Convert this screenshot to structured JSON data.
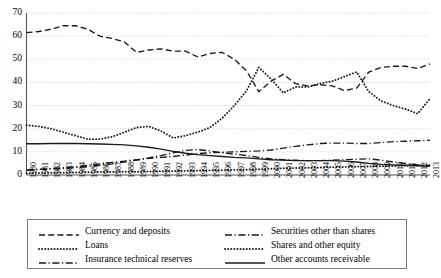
{
  "chart_data": {
    "type": "line",
    "title": "",
    "xlabel": "",
    "ylabel": "",
    "ylim": [
      0,
      70
    ],
    "ytick_step": 10,
    "grid": true,
    "legend_position": "bottom",
    "yticks": [
      "0",
      "10",
      "20",
      "30",
      "40",
      "50",
      "60",
      "70"
    ],
    "categories": [
      "1980",
      "1981",
      "1982",
      "1983",
      "1984",
      "1985",
      "1986",
      "1987",
      "1988",
      "1989",
      "1990",
      "1991",
      "1992",
      "1993",
      "1994",
      "1995",
      "1996",
      "1997",
      "1998",
      "1999",
      "2000",
      "2001",
      "2002",
      "2003",
      "2004",
      "2005",
      "2006",
      "2007",
      "2008",
      "2009",
      "2010",
      "2011",
      "2012",
      "2013"
    ],
    "series": [
      {
        "name": "Currency and deposits",
        "style": "dashed",
        "values": [
          61.5,
          62.0,
          63.0,
          64.5,
          64.5,
          63.0,
          60.0,
          59.0,
          57.5,
          53.0,
          54.0,
          54.5,
          53.5,
          53.5,
          51.0,
          52.5,
          53.0,
          50.0,
          45.0,
          36.0,
          40.5,
          43.5,
          39.5,
          38.5,
          39.0,
          38.5,
          36.5,
          37.5,
          44.5,
          46.5,
          47.0,
          47.0,
          46.0,
          48.0
        ]
      },
      {
        "name": "Loans",
        "style": "dotted",
        "values": [
          0.8,
          0.9,
          1.0,
          1.0,
          1.1,
          1.2,
          1.3,
          1.3,
          1.4,
          1.4,
          1.5,
          1.6,
          1.7,
          1.8,
          1.9,
          2.0,
          2.1,
          2.2,
          2.3,
          2.5,
          2.7,
          2.9,
          3.0,
          3.1,
          3.2,
          3.4,
          3.5,
          3.6,
          3.7,
          3.8,
          3.9,
          4.0,
          4.1,
          4.2
        ]
      },
      {
        "name": "Insurance technical reserves",
        "style": "dashdot",
        "values": [
          2.0,
          2.4,
          2.8,
          3.2,
          3.6,
          4.2,
          4.8,
          5.4,
          6.0,
          6.6,
          7.2,
          7.6,
          8.0,
          8.6,
          9.2,
          9.6,
          9.8,
          10.0,
          10.2,
          10.4,
          10.8,
          11.6,
          12.4,
          13.0,
          13.6,
          13.8,
          13.8,
          13.6,
          13.6,
          14.0,
          14.4,
          14.6,
          14.8,
          15.0
        ]
      },
      {
        "name": "Securities other than shares",
        "style": "dashdot",
        "values": [
          2.2,
          2.4,
          2.6,
          2.8,
          3.2,
          3.6,
          4.2,
          4.8,
          5.6,
          6.4,
          7.4,
          8.4,
          9.6,
          10.6,
          11.0,
          10.4,
          9.6,
          9.0,
          8.4,
          7.6,
          7.0,
          6.6,
          6.4,
          6.2,
          6.2,
          6.4,
          6.6,
          6.8,
          7.0,
          6.4,
          5.6,
          5.0,
          4.4,
          4.0
        ]
      },
      {
        "name": "Shares and other equity",
        "style": "dotted",
        "values": [
          21.5,
          21.0,
          20.0,
          18.5,
          17.0,
          15.5,
          15.5,
          16.5,
          18.5,
          20.5,
          21.0,
          19.0,
          16.0,
          17.0,
          18.5,
          20.5,
          24.5,
          30.0,
          36.5,
          46.5,
          41.5,
          35.5,
          38.0,
          38.0,
          39.5,
          40.5,
          42.5,
          44.5,
          36.0,
          32.0,
          30.0,
          28.5,
          26.5,
          33.0
        ]
      },
      {
        "name": "Other accounts receivable",
        "style": "solid",
        "values": [
          13.5,
          13.5,
          13.6,
          13.6,
          13.6,
          13.5,
          13.4,
          13.2,
          13.0,
          12.6,
          12.0,
          11.2,
          10.2,
          9.4,
          8.8,
          8.4,
          8.0,
          7.6,
          7.4,
          7.0,
          6.6,
          6.4,
          6.2,
          6.2,
          6.2,
          6.2,
          6.0,
          5.6,
          5.0,
          4.6,
          4.4,
          4.2,
          4.0,
          3.8
        ]
      }
    ]
  },
  "legend": {
    "left_column": [
      {
        "label": "Currency and deposits",
        "style": "dashed"
      },
      {
        "label": "Loans",
        "style": "dotted"
      },
      {
        "label": "Insurance technical reserves",
        "style": "dashdot"
      }
    ],
    "right_column": [
      {
        "label": "Securities other than shares",
        "style": "dashdot"
      },
      {
        "label": "Shares and other equity",
        "style": "dotted"
      },
      {
        "label": "Other accounts receivable",
        "style": "solid"
      }
    ]
  },
  "colors": {
    "line": "#1a1a1a",
    "grid": "#c9c9c9",
    "axis": "#555555",
    "legend_border": "#7a7a7a"
  }
}
